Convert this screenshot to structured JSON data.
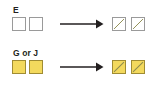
{
  "diagram": {
    "type": "rule-diagram",
    "background_color": "#ffffff",
    "colors": {
      "empty_fill": "#ffffff",
      "empty_stroke": "#9a9a9a",
      "filled_fill": "#f3d95d",
      "filled_stroke": "#a08c33",
      "diagonal_stroke": "#8c8a4e",
      "arrow_color": "#231f20",
      "label_color": "#231f20"
    },
    "rows": [
      {
        "label": "E",
        "input": {
          "cells": [
            {
              "state": "empty",
              "diagonal": "none"
            },
            {
              "state": "empty",
              "diagonal": "none"
            }
          ]
        },
        "operator": "arrow-right",
        "output": {
          "cells": [
            {
              "state": "empty",
              "diagonal": "bottom-left-to-top-right"
            },
            {
              "state": "empty",
              "diagonal": "bottom-left-to-top-right"
            }
          ]
        }
      },
      {
        "label": "G or J",
        "input": {
          "cells": [
            {
              "state": "filled",
              "diagonal": "none"
            },
            {
              "state": "filled",
              "diagonal": "none"
            }
          ]
        },
        "operator": "arrow-right",
        "output": {
          "cells": [
            {
              "state": "filled",
              "diagonal": "bottom-left-to-top-right"
            },
            {
              "state": "filled",
              "diagonal": "bottom-left-to-top-right"
            }
          ]
        }
      }
    ]
  }
}
